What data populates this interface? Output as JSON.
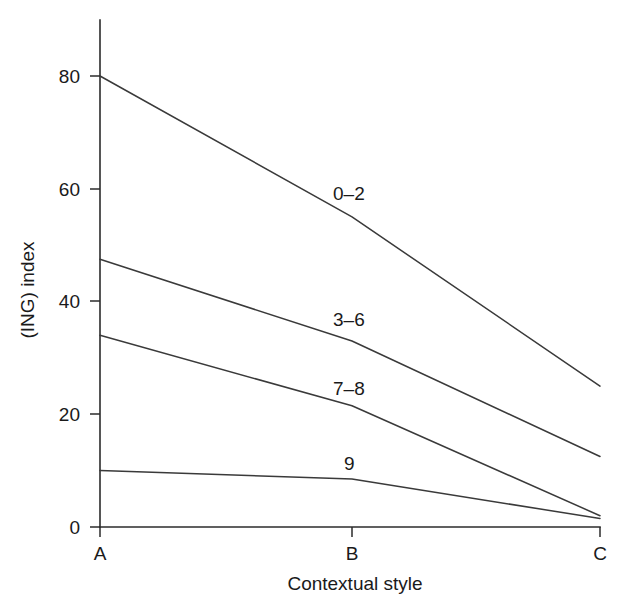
{
  "chart_data": {
    "type": "line",
    "title": "",
    "xlabel": "Contextual style",
    "ylabel": "(ING) index",
    "categories": [
      "A",
      "B",
      "C"
    ],
    "xticklabels": [
      "A",
      "B",
      "C"
    ],
    "yticklabels": [
      "0",
      "20",
      "40",
      "60",
      "80"
    ],
    "yticks": [
      0,
      20,
      40,
      60,
      80
    ],
    "ylim": [
      0,
      88
    ],
    "grid": false,
    "legend": "inline-labels",
    "series": [
      {
        "name": "0–2",
        "values": [
          80,
          55,
          25
        ],
        "label": "0–2"
      },
      {
        "name": "3–6",
        "values": [
          47.5,
          33,
          12.5
        ],
        "label": "3–6"
      },
      {
        "name": "7–8",
        "values": [
          34,
          21.5,
          2
        ],
        "label": "7–8"
      },
      {
        "name": "9",
        "values": [
          10,
          8.5,
          1.5
        ],
        "label": "9"
      }
    ]
  },
  "axes": {
    "y_title": "(ING) index",
    "x_title": "Contextual style",
    "y_tick_0": "0",
    "y_tick_20": "20",
    "y_tick_40": "40",
    "y_tick_60": "60",
    "y_tick_80": "80",
    "x_tick_a": "A",
    "x_tick_b": "B",
    "x_tick_c": "C"
  },
  "series_labels": {
    "s0": "0–2",
    "s1": "3–6",
    "s2": "7–8",
    "s3": "9"
  },
  "colors": {
    "line": "#3a3a3a",
    "axis": "#2b2b2b",
    "text": "#1a1a1a",
    "background": "#ffffff"
  }
}
